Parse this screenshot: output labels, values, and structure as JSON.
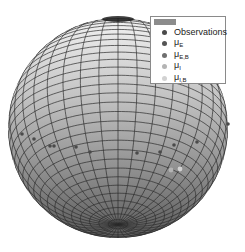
{
  "chart_data": {
    "type": "scatter",
    "subtype": "3d-sphere-scatter",
    "title": "",
    "xlabel": "",
    "ylabel": "",
    "zlabel": "",
    "grid": true,
    "legend_position": "upper-right",
    "surface": {
      "shape": "unit sphere",
      "mesh": "latitude-longitude grid",
      "shading": "gray gradient, lighter at top"
    },
    "legend": [
      {
        "label": "",
        "marker": "surface patch",
        "color": "#8c8c8c"
      },
      {
        "label": "Observations",
        "marker": "dot",
        "color": "#4a4a4a"
      },
      {
        "label": "μE",
        "base": "μ",
        "sub": "E",
        "marker": "dot",
        "color": "#555555"
      },
      {
        "label": "μE,B",
        "base": "μ",
        "sub": "E,B",
        "marker": "dot",
        "color": "#6f6f6f"
      },
      {
        "label": "μI",
        "base": "μ",
        "sub": "I",
        "marker": "dot",
        "color": "#b4b4b4"
      },
      {
        "label": "μI,B",
        "base": "μ",
        "sub": "I,B",
        "marker": "dot",
        "color": "#d2d2d2"
      }
    ],
    "points_screen": [
      {
        "series": "Observations",
        "x": 22,
        "y": 134
      },
      {
        "series": "Observations",
        "x": 34,
        "y": 139
      },
      {
        "series": "Observations",
        "x": 50,
        "y": 146
      },
      {
        "series": "Observations",
        "x": 54,
        "y": 146
      },
      {
        "series": "Observations",
        "x": 76,
        "y": 147
      },
      {
        "series": "Observations",
        "x": 90,
        "y": 152
      },
      {
        "series": "Observations",
        "x": 137,
        "y": 153
      },
      {
        "series": "Observations",
        "x": 160,
        "y": 152
      },
      {
        "series": "Observations",
        "x": 174,
        "y": 145
      },
      {
        "series": "Observations",
        "x": 197,
        "y": 142
      },
      {
        "series": "Observations",
        "x": 228,
        "y": 124
      },
      {
        "series": "μI",
        "x": 171,
        "y": 170
      },
      {
        "series": "μI,B",
        "x": 180,
        "y": 169
      }
    ]
  },
  "legend": {
    "items": [
      {
        "base": "Observations",
        "sub": "",
        "color": "#4a4a4a"
      },
      {
        "base": "μ",
        "sub": "E",
        "color": "#555555"
      },
      {
        "base": "μ",
        "sub": "E,B",
        "color": "#6f6f6f"
      },
      {
        "base": "μ",
        "sub": "I",
        "color": "#b4b4b4"
      },
      {
        "base": "μ",
        "sub": "I,B",
        "color": "#d2d2d2"
      }
    ]
  }
}
